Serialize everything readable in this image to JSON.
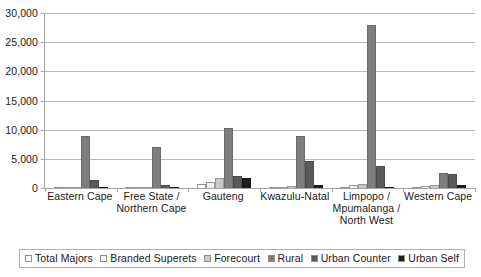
{
  "chart_data": {
    "type": "bar",
    "title": "",
    "subtitle": "",
    "xlabel": "",
    "ylabel": "",
    "ylim": [
      0,
      30000
    ],
    "y_ticks": [
      0,
      5000,
      10000,
      15000,
      20000,
      25000,
      30000
    ],
    "y_tick_labels": [
      "0",
      "5,000",
      "10,000",
      "15,000",
      "20,000",
      "25,000",
      "30,000"
    ],
    "grid": true,
    "legend_position": "bottom",
    "categories": [
      "Eastern Cape",
      "Free State /\nNorthern Cape",
      "Gauteng",
      "Kwazulu-Natal",
      "Limpopo /\nMpumalanga /\nNorth West",
      "Western Cape"
    ],
    "category_lines": [
      [
        "Eastern Cape"
      ],
      [
        "Free State /",
        "Northern Cape"
      ],
      [
        "Gauteng"
      ],
      [
        "Kwazulu-Natal"
      ],
      [
        "Limpopo /",
        "Mpumalanga /",
        "North West"
      ],
      [
        "Western Cape"
      ]
    ],
    "series": [
      {
        "name": "Total Majors",
        "color": "#ffffff",
        "values": [
          150,
          100,
          700,
          150,
          100,
          150
        ]
      },
      {
        "name": "Branded Superets",
        "color": "#efefef",
        "values": [
          150,
          120,
          1100,
          200,
          500,
          400
        ]
      },
      {
        "name": "Forecourt",
        "color": "#cacaca",
        "values": [
          180,
          120,
          1800,
          400,
          700,
          500
        ]
      },
      {
        "name": "Rural",
        "color": "#7d7d7d",
        "values": [
          9000,
          7000,
          10300,
          9000,
          28000,
          2500
        ]
      },
      {
        "name": "Urban Counter",
        "color": "#5a5a5a",
        "values": [
          1300,
          600,
          2100,
          4700,
          3800,
          2400
        ]
      },
      {
        "name": "Urban Self",
        "color": "#1c1c1c",
        "values": [
          120,
          90,
          1700,
          500,
          200,
          600
        ]
      }
    ]
  },
  "legend": {
    "items": [
      {
        "label": "Total Majors"
      },
      {
        "label": "Branded Superets"
      },
      {
        "label": "Forecourt"
      },
      {
        "label": "Rural"
      },
      {
        "label": "Urban Counter"
      },
      {
        "label": "Urban Self"
      }
    ]
  }
}
